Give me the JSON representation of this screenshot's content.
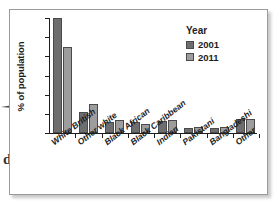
{
  "figure": {
    "frame_border_color": "#9a9a9a",
    "background": "#ffffff"
  },
  "artifacts": {
    "arrow_icon": "right-arrow-icon",
    "margin_letter": "d"
  },
  "chart_data": {
    "type": "bar",
    "title": "",
    "xlabel": "",
    "ylabel": "% of population",
    "ylim": [
      0,
      60
    ],
    "yticks": [
      0,
      10,
      20,
      30,
      40,
      50,
      60
    ],
    "grid": false,
    "legend_position": "top-right",
    "legend_title": "Year",
    "categories": [
      "White British",
      "Other white",
      "Black African",
      "Black Caribbean",
      "Indian",
      "Pakistani",
      "Bangladeshi",
      "Other"
    ],
    "series": [
      {
        "name": "2001",
        "color": "#6e6e6e",
        "values": [
          60,
          11,
          6,
          6,
          6.5,
          2.5,
          2.5,
          7.5
        ]
      },
      {
        "name": "2011",
        "color": "#9d9d9d",
        "values": [
          45,
          15,
          7,
          4.5,
          7,
          3,
          3,
          7.5
        ]
      }
    ]
  }
}
